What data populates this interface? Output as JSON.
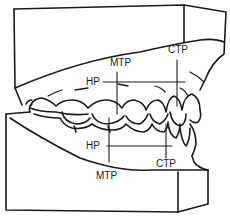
{
  "diagram": {
    "colors": {
      "line": "#1a1a1a",
      "background": "#ffffff"
    },
    "labels": {
      "upper": {
        "mtp": "MTP",
        "ctp": "CTP",
        "hp": "HP"
      },
      "lower": {
        "mtp": "MTP",
        "ctp": "CTP",
        "hp": "HP"
      }
    }
  }
}
